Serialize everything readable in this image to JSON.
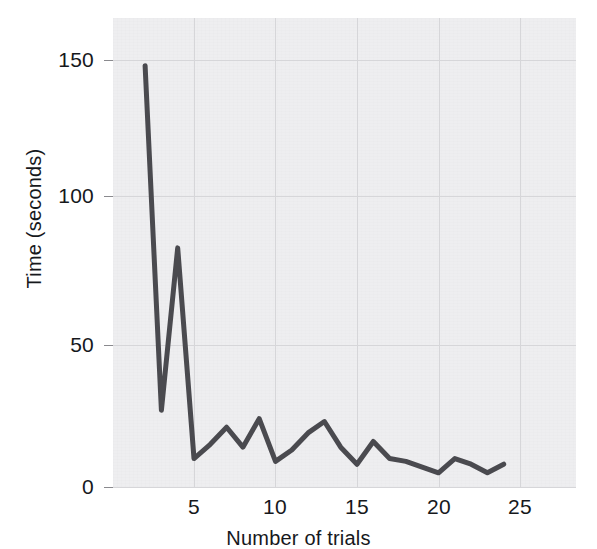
{
  "chart_data": {
    "type": "line",
    "title": "",
    "xlabel": "Number of trials",
    "ylabel": "Time (seconds)",
    "xlim": [
      1,
      26
    ],
    "ylim": [
      0,
      165
    ],
    "xticks": [
      5,
      10,
      15,
      20,
      25
    ],
    "yticks": [
      0,
      50,
      100,
      150
    ],
    "xtick_labels": [
      "5",
      "10",
      "15",
      "20",
      "25"
    ],
    "ytick_labels": [
      "0",
      "50",
      "100",
      "150"
    ],
    "grid": true,
    "legend": "none",
    "line_color": "#4a4a4f",
    "plot_background": "#eeeef0",
    "grid_color": "#d6d6d9",
    "x": [
      2,
      3,
      4,
      5,
      6,
      7,
      8,
      9,
      10,
      11,
      12,
      13,
      14,
      15,
      16,
      17,
      18,
      19,
      20,
      21,
      22,
      23,
      24
    ],
    "values": [
      148,
      27,
      84,
      10,
      15,
      21,
      14,
      24,
      9,
      13,
      19,
      23,
      14,
      8,
      16,
      10,
      9,
      7,
      5,
      10,
      8,
      5,
      8
    ],
    "series": [
      {
        "name": "Time per trial",
        "values": [
          148,
          27,
          84,
          10,
          15,
          21,
          14,
          24,
          9,
          13,
          19,
          23,
          14,
          8,
          16,
          10,
          9,
          7,
          5,
          10,
          8,
          5,
          8
        ]
      }
    ]
  },
  "axes": {
    "y_ticks": [
      {
        "label": "150",
        "value": 150
      },
      {
        "label": "100",
        "value": 100
      },
      {
        "label": "50",
        "value": 50
      },
      {
        "label": "0",
        "value": 0
      }
    ],
    "x_ticks": [
      {
        "label": "5",
        "value": 5
      },
      {
        "label": "10",
        "value": 10
      },
      {
        "label": "15",
        "value": 15
      },
      {
        "label": "20",
        "value": 20
      },
      {
        "label": "25",
        "value": 25
      }
    ],
    "x_axis_title": "Number of trials",
    "y_axis_title": "Time (seconds)"
  }
}
